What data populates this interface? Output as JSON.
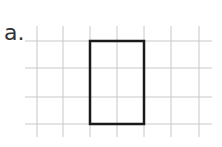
{
  "problem": {
    "label": "a."
  },
  "grid": {
    "vertical_lines_x": [
      37,
      63,
      90,
      117,
      144,
      171,
      199
    ],
    "horizontal_lines_y": [
      41,
      68,
      97,
      124
    ],
    "x_extent": [
      25,
      212
    ],
    "y_extent": [
      26,
      137
    ],
    "line_color": "#c8c8c8"
  },
  "rectangle": {
    "x": 90,
    "y": 41,
    "width": 54,
    "height": 83,
    "grid_width_units": 2,
    "grid_height_units": 3,
    "stroke_color": "#1a1a1a"
  }
}
